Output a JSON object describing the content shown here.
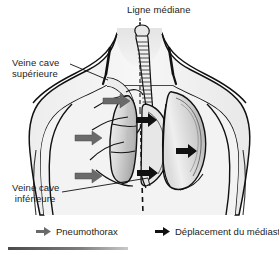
{
  "figure": {
    "title_label": "Ligne médiane",
    "background_color": "#ffffff"
  },
  "annotations": {
    "midline": {
      "label": "Ligne médiane",
      "leader": "dashed-vertical-line"
    },
    "superior_vena_cava": {
      "line1": "Veine cave",
      "line2": "supérieure",
      "full": "Veine cave supérieure"
    },
    "inferior_vena_cava": {
      "line1": "Veine cave",
      "line2": "inférieure",
      "full": "Veine cave inférieure"
    }
  },
  "legend": {
    "items": [
      {
        "id": "pneumothorax",
        "label": "Pneumothorax",
        "arrow_color": "#6a6a6a",
        "arrow_direction": "right"
      },
      {
        "id": "mediastinal-shift",
        "label": "Déplacement du médiastin",
        "arrow_color": "#111111",
        "arrow_direction": "right"
      }
    ]
  },
  "colors": {
    "outline": "#111111",
    "body_fill": "#f2f2f2",
    "lung_light": "#e9e9e9",
    "lung_mid": "#cfcfcf",
    "lung_dark": "#a8a8a8",
    "pneumo_arrow": "#6a6a6a",
    "mediastinal_arrow": "#111111",
    "text": "#1c1c1c",
    "footer_bar": "#5a5a5a"
  },
  "anatomy": {
    "trachea": "segmented-cartilage-rings",
    "collapsed_lung_side": "patient-right (image left)",
    "expanded_lung_side": "patient-left (image right)",
    "pneumothorax_arrow_count": 3,
    "mediastinal_arrow_count": 3
  }
}
